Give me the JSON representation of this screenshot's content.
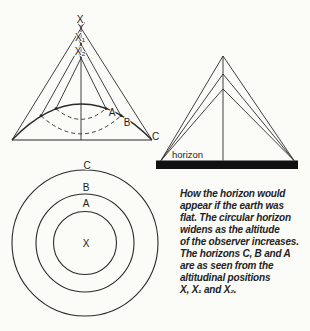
{
  "colors": {
    "ink": "#2a2a2a",
    "paper": "#fbfbf8",
    "horizon_bar": "#111111"
  },
  "cone_figure": {
    "apex_labels": {
      "top": "X",
      "middle": "X₁",
      "lower": "X₂"
    },
    "horizon_points": {
      "a": "A",
      "b": "B",
      "c": "C"
    }
  },
  "flat_figure": {
    "horizon_label": "horizon"
  },
  "circles_figure": {
    "outer": "C",
    "middle": "B",
    "inner": "A",
    "center": "X"
  },
  "caption": {
    "lines": [
      "How the horizon would",
      "appear if the earth was",
      "flat. The circular horizon",
      "widens as the altitude",
      "of the observer increases.",
      "The horizons C, B and A",
      "are as seen from the",
      "altitudinal positions",
      "X, X₁ and X₂."
    ]
  }
}
